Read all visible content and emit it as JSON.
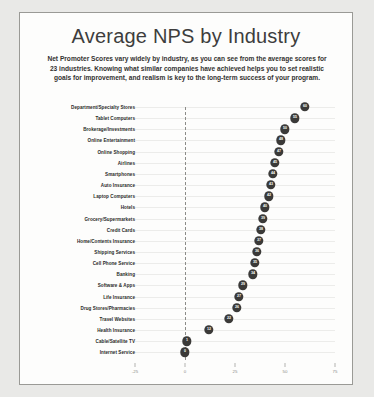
{
  "chart_data": {
    "type": "scatter",
    "title": "Average NPS by Industry",
    "subtitle": "Net Promoter Scores vary widely by industry, as you can see from the average scores for 23 industries. Knowing what similar companies have achieved helps you to set realistic goals for improvement, and realism is key to the long-term success of your program.",
    "xlabel": "",
    "ylabel": "",
    "xlim": [
      -25,
      75
    ],
    "ticks": [
      -25,
      0,
      25,
      50,
      75
    ],
    "grid": true,
    "legend": false,
    "zero_reference_line": 0,
    "marker_color": "#3b3a38",
    "label_color": "#ffffff",
    "categories": [
      "Department/Specialty Stores",
      "Tablet Computers",
      "Brokerage/Investments",
      "Online Entertainment",
      "Online Shopping",
      "Airlines",
      "Smartphones",
      "Auto Insurance",
      "Laptop Computers",
      "Hotels",
      "Grocery/Supermarkets",
      "Credit Cards",
      "Home/Contents Insurance",
      "Shipping Services",
      "Cell Phone Service",
      "Banking",
      "Software & Apps",
      "Life Insurance",
      "Drug Stores/Pharmacies",
      "Travel Websites",
      "Health Insurance",
      "Cable/Satellite TV",
      "Internet Service"
    ],
    "values": [
      60,
      55,
      50,
      48,
      47,
      45,
      44,
      43,
      42,
      40,
      39,
      38,
      37,
      36,
      35,
      34,
      29,
      27,
      26,
      22,
      12,
      1,
      0
    ]
  }
}
